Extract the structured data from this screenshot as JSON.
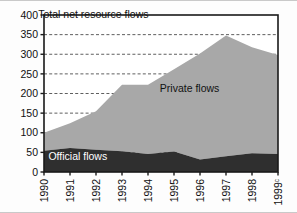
{
  "chart_data": {
    "type": "area",
    "title": "",
    "xlabel": "",
    "ylabel": "",
    "stacked": true,
    "grid": true,
    "grid_style": "dashed-horizontal",
    "legend_position": "inline-annotations",
    "ylim": [
      0,
      400
    ],
    "yticks": [
      0,
      50,
      100,
      150,
      200,
      250,
      300,
      350,
      400
    ],
    "ytick_labels": [
      "0",
      "50",
      "100",
      "150",
      "200",
      "250",
      "300",
      "350",
      "400"
    ],
    "categories": [
      "1990",
      "1991",
      "1992",
      "1993",
      "1994",
      "1995",
      "1996",
      "1997",
      "1998",
      "1999"
    ],
    "xtick_labels": [
      "1990",
      "1991",
      "1992",
      "1993",
      "1994",
      "1995",
      "1996",
      "1997",
      "1998",
      "1999"
    ],
    "xtick_superscripts": [
      "",
      "",
      "",
      "",
      "",
      "",
      "",
      "",
      "",
      "c"
    ],
    "series": [
      {
        "name": "Official flows",
        "color": "#2f2f2f",
        "values": [
          54,
          61,
          57,
          53,
          46,
          52,
          32,
          40,
          48,
          46
        ]
      },
      {
        "name": "Private flows",
        "color": "#a8a8a8",
        "values": [
          46,
          63,
          98,
          169,
          176,
          210,
          270,
          308,
          270,
          252
        ]
      }
    ],
    "totals": {
      "name": "Total net resource flows",
      "values": [
        100,
        124,
        155,
        222,
        222,
        262,
        302,
        348,
        318,
        298
      ]
    },
    "annotations": [
      {
        "text": "Total net resource flows",
        "x": 1991.9,
        "y": 392,
        "color": "#121212",
        "anchor": "middle"
      },
      {
        "text": "Private flows",
        "x": 1995.6,
        "y": 205,
        "color": "#121212",
        "anchor": "middle"
      },
      {
        "text": "Official flows",
        "x": 1991.3,
        "y": 30,
        "color": "#ffffff",
        "anchor": "middle"
      }
    ]
  },
  "colors": {
    "official_flows": "#2f2f2f",
    "private_flows": "#a8a8a8",
    "axis": "#1a1a1a",
    "gridline": "#4d4d4d",
    "background": "#ffffff"
  }
}
